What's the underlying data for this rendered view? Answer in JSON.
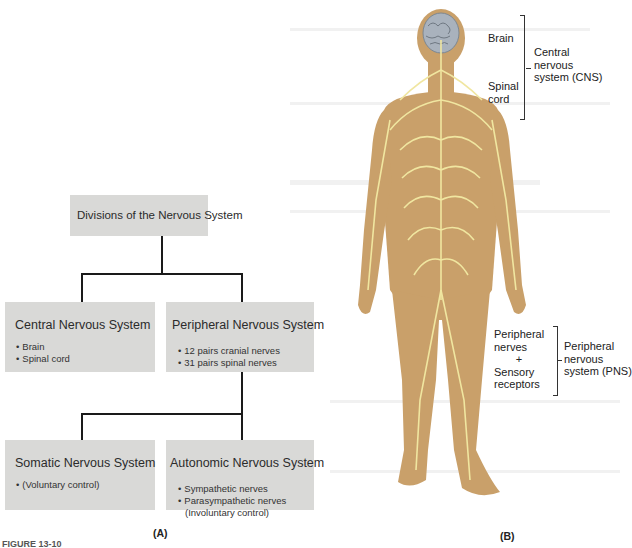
{
  "panel_a": {
    "label": "(A)",
    "root": {
      "title": "Divisions of the Nervous System"
    },
    "cns": {
      "title": "Central Nervous System",
      "items": [
        "Brain",
        "Spinal cord"
      ]
    },
    "pns": {
      "title": "Peripheral Nervous System",
      "items": [
        "12 pairs cranial nerves",
        "31 pairs spinal nerves"
      ]
    },
    "sns": {
      "title": "Somatic Nervous System",
      "items": [
        "(Voluntary control)"
      ]
    },
    "ans": {
      "title": "Autonomic Nervous System",
      "items": [
        "Sympathetic nerves",
        "Parasympathetic nerves",
        "(Involuntary control)"
      ]
    }
  },
  "panel_b": {
    "label": "(B)",
    "labels": {
      "brain": "Brain",
      "spinal_cord_1": "Spinal",
      "spinal_cord_2": "cord",
      "cns_1": "Central",
      "cns_2": "nervous",
      "cns_3": "system (CNS)",
      "pn_1": "Peripheral",
      "pn_2": "nerves",
      "pn_plus": "+",
      "pn_3": "Sensory",
      "pn_4": "receptors",
      "pns_1": "Peripheral",
      "pns_2": "nervous",
      "pns_3": "system (PNS)"
    },
    "colors": {
      "skin": "#c9a06a",
      "nerve": "#f0e6a0",
      "brain": "#a9b2bd"
    }
  },
  "figure_caption": "FIGURE 13-10"
}
